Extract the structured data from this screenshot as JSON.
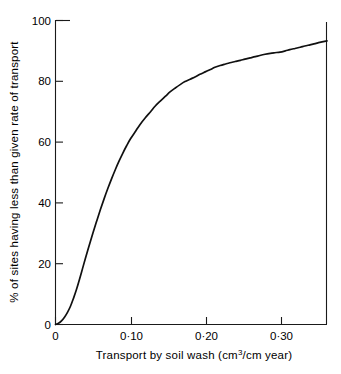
{
  "chart_data": {
    "type": "line",
    "title": "",
    "subtitle": "",
    "xlabel": "Transport by soil  wash (cm3/cm year)",
    "xlabel_main": "Transport by soil  wash (cm",
    "xlabel_sup": "3",
    "xlabel_tail": "/cm year)",
    "ylabel": "% of sites having less than given rate of transport",
    "xlim": [
      0,
      0.3627
    ],
    "ylim": [
      0,
      100
    ],
    "xticks": [
      0,
      0.1,
      0.2,
      0.3
    ],
    "xtick_labels": [
      "0",
      "0·10",
      "0·20",
      "0·30"
    ],
    "yticks": [
      0,
      20,
      40,
      60,
      80,
      100
    ],
    "ytick_labels": [
      "0",
      "20",
      "40",
      "60",
      "80",
      "100"
    ],
    "grid": false,
    "legend": false,
    "legend_position": "none",
    "series": [
      {
        "name": "cumulative % of sites",
        "line_color": "#101010",
        "x": [
          0.0,
          0.004,
          0.008,
          0.012,
          0.016,
          0.02,
          0.024,
          0.028,
          0.032,
          0.036,
          0.04,
          0.045,
          0.05,
          0.055,
          0.06,
          0.065,
          0.07,
          0.075,
          0.08,
          0.085,
          0.09,
          0.095,
          0.1,
          0.107,
          0.113,
          0.12,
          0.127,
          0.133,
          0.14,
          0.147,
          0.153,
          0.16,
          0.167,
          0.173,
          0.18,
          0.187,
          0.193,
          0.2,
          0.207,
          0.213,
          0.22,
          0.227,
          0.233,
          0.24,
          0.247,
          0.253,
          0.26,
          0.267,
          0.273,
          0.28,
          0.287,
          0.293,
          0.3,
          0.307,
          0.313,
          0.32,
          0.327,
          0.333,
          0.34,
          0.347,
          0.353,
          0.3627
        ],
        "y": [
          0.0,
          0.4,
          1.2,
          2.4,
          4.0,
          6.0,
          8.6,
          11.5,
          14.8,
          18.3,
          21.8,
          26.0,
          30.1,
          34.0,
          37.8,
          41.4,
          44.8,
          48.0,
          51.0,
          53.8,
          56.4,
          58.8,
          61.0,
          63.6,
          65.8,
          68.0,
          70.0,
          71.8,
          73.5,
          75.1,
          76.5,
          77.8,
          79.0,
          79.9,
          80.7,
          81.5,
          82.3,
          83.1,
          83.9,
          84.6,
          85.2,
          85.7,
          86.1,
          86.5,
          86.9,
          87.3,
          87.7,
          88.1,
          88.5,
          88.9,
          89.2,
          89.4,
          89.6,
          90.0,
          90.4,
          90.8,
          91.2,
          91.6,
          92.0,
          92.4,
          92.8,
          93.3
        ]
      }
    ],
    "annotations": []
  },
  "axes": {
    "x_axis_name": "x-axis",
    "y_axis_name": "y-axis"
  }
}
